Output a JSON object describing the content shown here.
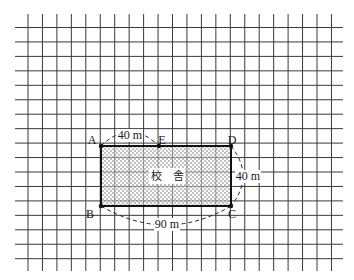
{
  "diagram": {
    "type": "grid-plan",
    "grid": {
      "x0": 28.0,
      "y0": 27.5,
      "step": 14.45,
      "cols": 22,
      "rows": 17,
      "h_line_x_start": 15,
      "h_line_x_end": 343,
      "v_line_y_start": 14,
      "v_line_y_end": 271,
      "line_color": "#3a3a3a"
    },
    "building": {
      "label": "校　舎",
      "fill_pattern": "dots",
      "border_color": "#111111",
      "corners": {
        "A": {
          "x": 101,
          "y": 146
        },
        "B": {
          "x": 101,
          "y": 206
        },
        "C": {
          "x": 231,
          "y": 206
        },
        "D": {
          "x": 231,
          "y": 146
        }
      },
      "point_E": {
        "x": 159,
        "y": 146
      }
    },
    "points": [
      {
        "name": "A",
        "x": 92,
        "y": 144
      },
      {
        "name": "E",
        "x": 162,
        "y": 144
      },
      {
        "name": "D",
        "x": 232,
        "y": 144
      },
      {
        "name": "B",
        "x": 90,
        "y": 218
      },
      {
        "name": "C",
        "x": 232,
        "y": 218
      }
    ],
    "measurements": [
      {
        "id": "AE",
        "label": "40 m",
        "x": 130,
        "y": 139
      },
      {
        "id": "DC",
        "label": "40 m",
        "x": 248,
        "y": 180
      },
      {
        "id": "BC",
        "label": "90 m",
        "x": 167,
        "y": 228
      }
    ]
  }
}
